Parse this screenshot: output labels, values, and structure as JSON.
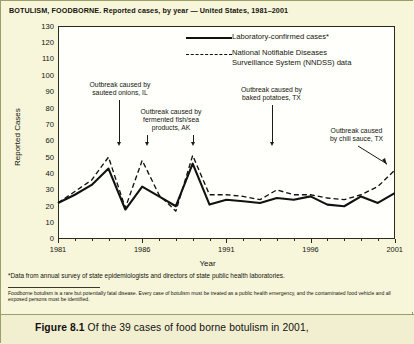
{
  "chart_title": "BOTULISM, FOODBORNE. Reported cases, by year — United States, 1981–2001",
  "axes": {
    "y_title": "Reported Cases",
    "x_title": "Year",
    "y_ticks": [
      "130",
      "120",
      "110",
      "100",
      "90",
      "80",
      "70",
      "60",
      "50",
      "40",
      "30",
      "20",
      "10",
      "0"
    ],
    "x_ticks": [
      "1981",
      "1986",
      "1991",
      "1996",
      "2001"
    ]
  },
  "legend": {
    "items": [
      {
        "label": "Laboratory-confirmed cases*",
        "style": "solid"
      },
      {
        "label": "National Notifiable Diseases\nSurveillance System (NNDSS) data",
        "style": "dashed"
      }
    ],
    "item1_line1": "National Notifiable Diseases",
    "item1_line2": "Surveillance System (NNDSS) data"
  },
  "annotations": [
    {
      "id": "onions",
      "line1": "Outbreak caused by",
      "line2": "sauteed onions, IL",
      "target_year": 1983
    },
    {
      "id": "fish",
      "line1": "Outbreak caused by",
      "line2": "fermented fish/sea",
      "line3": "products, AK",
      "target_years": [
        1985,
        1987
      ]
    },
    {
      "id": "potatoes",
      "line1": "Outbreak caused by",
      "line2": "baked potatoes, TX",
      "target_year": 1994
    },
    {
      "id": "chili",
      "line1": "Outbreak caused",
      "line2": "by chili sauce, TX",
      "target_year": 2001
    }
  ],
  "footnotes": {
    "primary": "*Data from annual survey of state epidemiologists and directors of state public health laboratories.",
    "secondary": "Foodborne botulism is a rare but potentially fatal disease. Every case of botulism must be treated as a public health emergency, and the contaminated food vehicle and all exposed persons must be identified."
  },
  "caption": {
    "figure_label": "Figure 8.1",
    "text": "Of the 39 cases of food borne botulism in 2001,"
  },
  "colors": {
    "page_background": "#f7f5da",
    "plot_background": "#fffffb",
    "line": "#111111",
    "axis": "#2a2a20",
    "caption_background": "#f2efd0"
  },
  "chart_data": {
    "type": "line",
    "title": "BOTULISM, FOODBORNE. Reported cases, by year — United States, 1981–2001",
    "xlabel": "Year",
    "ylabel": "Reported Cases",
    "xlim": [
      1981,
      2001
    ],
    "ylim": [
      0,
      130
    ],
    "ytick_step": 10,
    "grid": false,
    "legend_position": "top-right-inside",
    "x": [
      1981,
      1982,
      1983,
      1984,
      1985,
      1986,
      1987,
      1988,
      1989,
      1990,
      1991,
      1992,
      1993,
      1994,
      1995,
      1996,
      1997,
      1998,
      1999,
      2000,
      2001
    ],
    "series": [
      {
        "name": "Laboratory-confirmed cases*",
        "style": "solid",
        "values": [
          22,
          27,
          33,
          43,
          18,
          32,
          26,
          20,
          46,
          21,
          24,
          23,
          22,
          25,
          24,
          26,
          21,
          20,
          26,
          22,
          28
        ]
      },
      {
        "name": "National Notifiable Diseases Surveillance System (NNDSS) data",
        "style": "dashed",
        "values": [
          22,
          29,
          36,
          50,
          19,
          48,
          27,
          17,
          51,
          27,
          27,
          26,
          24,
          30,
          27,
          27,
          25,
          24,
          27,
          32,
          42
        ]
      }
    ]
  }
}
